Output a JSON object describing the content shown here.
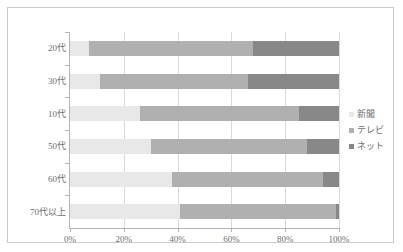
{
  "chart_data": {
    "type": "bar",
    "subtype": "100% stacked horizontal bar",
    "title": "",
    "xlabel": "",
    "ylabel": "",
    "xlim": [
      0,
      100
    ],
    "xticks": [
      "0%",
      "20%",
      "40%",
      "60%",
      "80%",
      "100%"
    ],
    "xtick_values": [
      0,
      20,
      40,
      60,
      80,
      100
    ],
    "grid": true,
    "grid_axis": "x",
    "legend_position": "right",
    "categories": [
      "20代",
      "30代",
      "10代",
      "50代",
      "60代",
      "70代以上"
    ],
    "series": [
      {
        "name": "新聞",
        "color": "#e8e8e8",
        "values": [
          7,
          11,
          26,
          30,
          38,
          41
        ]
      },
      {
        "name": "テレビ",
        "color": "#b0b0b0",
        "values": [
          61,
          55,
          59,
          58,
          56,
          58
        ]
      },
      {
        "name": "ネット",
        "color": "#888888",
        "values": [
          32,
          34,
          15,
          12,
          6,
          1
        ]
      }
    ]
  },
  "colors": {
    "newspaper": "#e8e8e8",
    "television": "#b0b0b0",
    "internet": "#888888",
    "axis": "#b4b4b4",
    "gridline": "#d9d9d9",
    "border": "#c9c9c9",
    "text": "#6e6e6e",
    "background": "#ffffff"
  }
}
